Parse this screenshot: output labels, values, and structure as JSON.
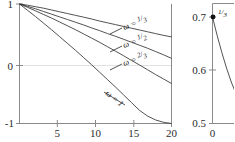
{
  "figure": {
    "kind": "two-panel-line-plot",
    "background": "#ffffff",
    "curve_color": "#333333",
    "axis_color": "#8a8a8a",
    "grid_color": "#d9d9d9"
  },
  "chart_data": [
    {
      "type": "line",
      "panel": "left",
      "title": "",
      "xlabel": "",
      "ylabel": "",
      "xlim": [
        1,
        20
      ],
      "ylim": [
        -1,
        1
      ],
      "grid": true,
      "legend": "inline-curve-labels",
      "xticks": [
        5,
        10,
        15,
        20
      ],
      "xtick_labels": [
        "5",
        "10",
        "15",
        "20"
      ],
      "yticks": [
        -1,
        0,
        1
      ],
      "ytick_labels": [
        "-1",
        "0",
        "1"
      ],
      "series": [
        {
          "name": "omega = 1/3",
          "label": "ω = ",
          "label_fraction": "1/3",
          "label_num": "1",
          "label_den": "3",
          "x": [
            1,
            2,
            3,
            4,
            5,
            6,
            7,
            8,
            9,
            10,
            11,
            12,
            13,
            14,
            15,
            16,
            17,
            18,
            19,
            20
          ],
          "values": [
            1.0,
            0.98,
            0.955,
            0.93,
            0.9,
            0.87,
            0.84,
            0.81,
            0.78,
            0.75,
            0.715,
            0.685,
            0.655,
            0.625,
            0.595,
            0.565,
            0.535,
            0.505,
            0.475,
            0.45
          ]
        },
        {
          "name": "omega = 1/2",
          "label": "ω = ",
          "label_fraction": "1/2",
          "label_num": "1",
          "label_den": "2",
          "x": [
            1,
            2,
            3,
            4,
            5,
            6,
            7,
            8,
            9,
            10,
            11,
            12,
            13,
            14,
            15,
            16,
            17,
            18,
            19,
            20
          ],
          "values": [
            1.0,
            0.96,
            0.92,
            0.875,
            0.83,
            0.785,
            0.74,
            0.695,
            0.65,
            0.6,
            0.555,
            0.505,
            0.46,
            0.41,
            0.36,
            0.31,
            0.26,
            0.205,
            0.15,
            0.09
          ]
        },
        {
          "name": "omega = 2/3",
          "label": "ω = ",
          "label_fraction": "2/3",
          "label_num": "2",
          "label_den": "3",
          "x": [
            1,
            2,
            3,
            4,
            5,
            6,
            7,
            8,
            9,
            10,
            11,
            12,
            13,
            14,
            15,
            16,
            17,
            18,
            19,
            20
          ],
          "values": [
            1.0,
            0.945,
            0.885,
            0.825,
            0.765,
            0.7,
            0.635,
            0.57,
            0.5,
            0.43,
            0.36,
            0.285,
            0.21,
            0.135,
            0.055,
            -0.02,
            -0.1,
            -0.18,
            -0.255,
            -0.33
          ]
        },
        {
          "name": "omega = 1",
          "label": "ω = ",
          "label_fraction": "1",
          "label_num": "1",
          "label_den": "",
          "x": [
            1,
            2,
            3,
            4,
            5,
            6,
            7,
            8,
            9,
            10,
            11,
            12,
            13,
            14,
            15,
            16,
            17,
            18,
            19,
            20
          ],
          "values": [
            1.0,
            0.895,
            0.79,
            0.68,
            0.57,
            0.455,
            0.34,
            0.225,
            0.105,
            -0.015,
            -0.14,
            -0.265,
            -0.39,
            -0.52,
            -0.65,
            -0.78,
            -0.875,
            -0.94,
            -0.98,
            -1.0
          ]
        }
      ]
    },
    {
      "type": "line",
      "panel": "right",
      "note": "cropped at image edge",
      "title": "",
      "xlabel": "",
      "ylabel": "",
      "xlim": [
        0,
        4
      ],
      "ylim": [
        0.5,
        0.7
      ],
      "grid": false,
      "xticks": [
        0
      ],
      "xtick_labels": [
        "0"
      ],
      "yticks": [
        0.5,
        0.6,
        0.7
      ],
      "ytick_labels": [
        "0.5",
        "0.6",
        "0.7"
      ],
      "markers": [
        {
          "name": "point-one-third",
          "x": 0,
          "y": 0.7,
          "label_num": "1",
          "label_den": "3"
        }
      ],
      "series": [
        {
          "name": "omega = 1/3 detail",
          "x": [
            0,
            0.5,
            1,
            1.5,
            2,
            2.5,
            3,
            3.5,
            4
          ],
          "values": [
            0.7,
            0.665,
            0.633,
            0.604,
            0.578,
            0.556,
            0.537,
            0.521,
            0.508
          ]
        }
      ]
    }
  ]
}
